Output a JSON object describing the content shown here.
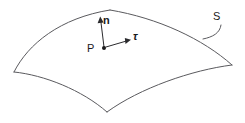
{
  "figure": {
    "kind": "geometry-diagram",
    "background_color": "#ffffff",
    "edge_color": "#5a5a5e",
    "vector_color": "#2b2b2e",
    "label_color": "#1a1a1c",
    "labels": {
      "surface": "S",
      "normal": "n",
      "tangent": "τ",
      "point": "P"
    },
    "geometry": {
      "left_vertex": [
        14,
        72
      ],
      "top_apex": [
        110,
        10
      ],
      "right_vertex": [
        232,
        65
      ],
      "bottom_cusp": [
        107,
        112
      ],
      "point_P": [
        104,
        48
      ],
      "normal_tip": [
        100,
        17
      ],
      "tangent_tip": [
        130,
        40
      ],
      "leader_start": [
        220,
        25
      ],
      "leader_end": [
        203,
        39
      ]
    }
  }
}
